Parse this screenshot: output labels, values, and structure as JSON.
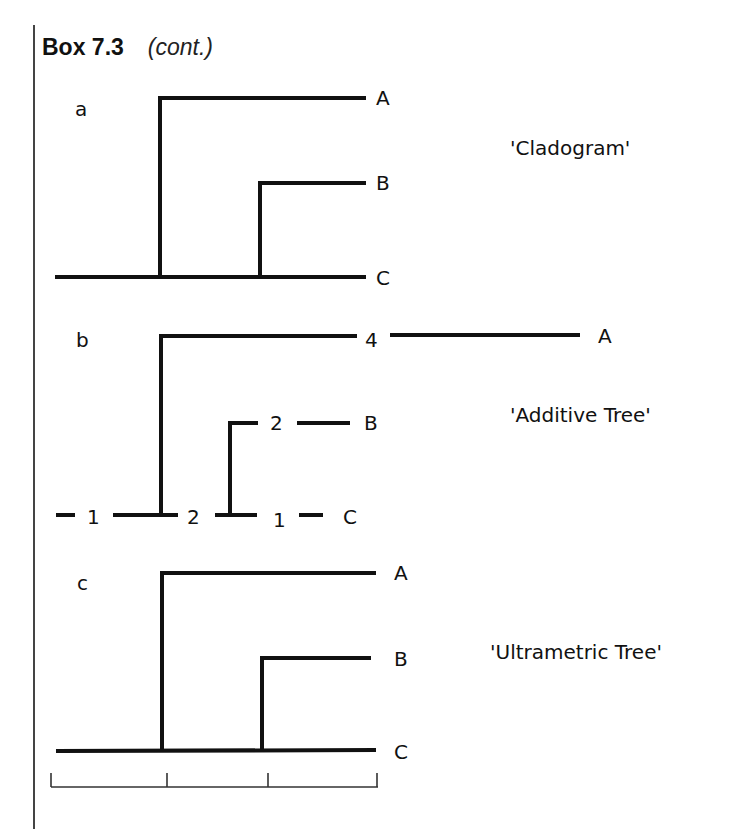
{
  "header": {
    "box_label": "Box 7.3",
    "cont_label": "(cont.)"
  },
  "colors": {
    "line": "#111111",
    "text": "#111111",
    "rule": "#444444"
  },
  "trees": [
    {
      "panel": "a",
      "name": "'Cladogram'",
      "taxa": [
        "A",
        "B",
        "C"
      ],
      "branch_lengths": []
    },
    {
      "panel": "b",
      "name": "'Additive Tree'",
      "taxa": [
        "A",
        "B",
        "C"
      ],
      "branch_lengths": {
        "root_stem": "1",
        "to_A": "4",
        "internal": "2",
        "to_B": "2",
        "to_C": "1"
      }
    },
    {
      "panel": "c",
      "name": "'Ultrametric Tree'",
      "taxa": [
        "A",
        "B",
        "C"
      ],
      "scale_bar_ticks": 4
    }
  ]
}
